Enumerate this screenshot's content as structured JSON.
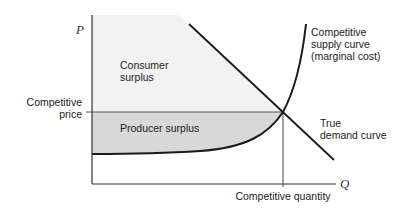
{
  "diagram": {
    "type": "economics-surplus",
    "axes": {
      "y_label": "P",
      "x_label": "Q"
    },
    "labels": {
      "consumer_surplus_1": "Consumer",
      "consumer_surplus_2": "surplus",
      "producer_surplus": "Producer surplus",
      "competitive_price_1": "Competitive",
      "competitive_price_2": "price",
      "competitive_quantity": "Competitive quantity",
      "supply_1": "Competitive",
      "supply_2": "supply curve",
      "supply_3": "(marginal cost)",
      "demand_1": "True",
      "demand_2": "demand curve"
    },
    "colors": {
      "consumer_fill": "#f1f1f1",
      "producer_fill": "#d6d6d6",
      "line": "#1a1a1a"
    }
  }
}
